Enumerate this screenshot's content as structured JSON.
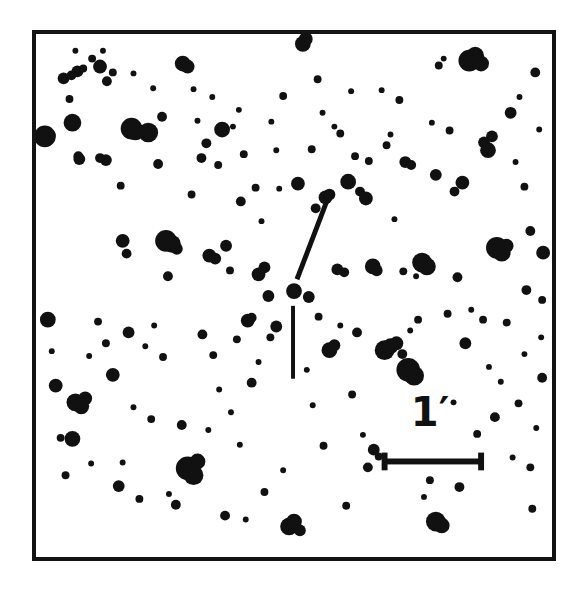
{
  "figure": {
    "kind": "astronomical-finding-chart",
    "background_color": "#ffffff",
    "ink_color": "#111111"
  },
  "frame": {
    "x": 32,
    "y": 30,
    "width": 524,
    "height": 531,
    "border_width": 4,
    "border_color": "#131313"
  },
  "scale_bar": {
    "label": "1′",
    "label_x": 426,
    "label_y": 408,
    "label_font_size": 40,
    "x1": 386,
    "x2": 484,
    "y": 464,
    "line_width": 6,
    "cap_height": 18,
    "cap_width": 6,
    "color": "#111111"
  },
  "target_marker": {
    "color": "#111111",
    "lines": [
      {
        "name": "diagonal-pointer",
        "x1": 328,
        "y1": 198,
        "x2": 297,
        "y2": 279,
        "width": 5
      },
      {
        "name": "vertical-pointer",
        "x1": 293,
        "y1": 306,
        "x2": 293,
        "y2": 380,
        "width": 4
      }
    ],
    "target_position": {
      "x": 294,
      "y": 291
    }
  },
  "chart_data": {
    "type": "scatter",
    "title": "",
    "xlabel": "",
    "ylabel": "",
    "xlim": [
      0,
      585
    ],
    "ylim": [
      0,
      596
    ],
    "grid": false,
    "legend": null,
    "marker_shape": "filled-circle",
    "marker_color": "#111111",
    "point_fields": [
      "x",
      "y",
      "r"
    ],
    "note": "x,y are pixel coordinates in the 585x596 image; r is the plotted disk radius in pixels (a proxy for stellar brightness).",
    "points": [
      [
        41,
        134,
        11
      ],
      [
        45,
        133,
        7
      ],
      [
        60,
        75,
        6
      ],
      [
        68,
        72,
        5
      ],
      [
        74,
        68,
        6
      ],
      [
        76,
        157,
        6
      ],
      [
        80,
        65,
        4
      ],
      [
        72,
        47,
        3
      ],
      [
        75,
        154,
        5
      ],
      [
        69,
        120,
        9
      ],
      [
        66,
        96,
        4
      ],
      [
        89,
        55,
        4
      ],
      [
        97,
        63,
        7
      ],
      [
        100,
        47,
        3
      ],
      [
        104,
        78,
        5
      ],
      [
        110,
        69,
        4
      ],
      [
        103,
        158,
        6
      ],
      [
        97,
        156,
        5
      ],
      [
        118,
        184,
        4
      ],
      [
        120,
        240,
        7
      ],
      [
        124,
        253,
        5
      ],
      [
        131,
        70,
        3
      ],
      [
        129,
        126,
        11
      ],
      [
        133,
        129,
        9
      ],
      [
        146,
        130,
        10
      ],
      [
        151,
        85,
        3
      ],
      [
        156,
        162,
        5
      ],
      [
        160,
        114,
        5
      ],
      [
        164,
        240,
        11
      ],
      [
        170,
        243,
        9
      ],
      [
        175,
        248,
        6
      ],
      [
        166,
        276,
        5
      ],
      [
        181,
        60,
        8
      ],
      [
        186,
        63,
        7
      ],
      [
        190,
        193,
        4
      ],
      [
        196,
        118,
        3
      ],
      [
        200,
        156,
        5
      ],
      [
        192,
        86,
        3
      ],
      [
        205,
        141,
        5
      ],
      [
        208,
        255,
        7
      ],
      [
        214,
        258,
        6
      ],
      [
        211,
        94,
        3
      ],
      [
        217,
        163,
        4
      ],
      [
        221,
        127,
        8
      ],
      [
        225,
        245,
        6
      ],
      [
        232,
        124,
        3
      ],
      [
        229,
        270,
        4
      ],
      [
        238,
        107,
        3
      ],
      [
        243,
        152,
        4
      ],
      [
        240,
        200,
        5
      ],
      [
        247,
        321,
        7
      ],
      [
        251,
        318,
        5
      ],
      [
        255,
        186,
        4
      ],
      [
        261,
        220,
        3
      ],
      [
        258,
        274,
        7
      ],
      [
        264,
        267,
        6
      ],
      [
        268,
        296,
        6
      ],
      [
        271,
        119,
        3
      ],
      [
        276,
        148,
        3
      ],
      [
        279,
        187,
        3
      ],
      [
        283,
        93,
        4
      ],
      [
        294,
        291,
        8
      ],
      [
        309,
        297,
        6
      ],
      [
        298,
        182,
        7
      ],
      [
        303,
        40,
        8
      ],
      [
        306,
        35,
        7
      ],
      [
        312,
        147,
        4
      ],
      [
        318,
        76,
        4
      ],
      [
        323,
        110,
        3
      ],
      [
        316,
        207,
        5
      ],
      [
        326,
        196,
        7
      ],
      [
        330,
        193,
        6
      ],
      [
        335,
        124,
        3
      ],
      [
        341,
        131,
        4
      ],
      [
        338,
        269,
        6
      ],
      [
        345,
        272,
        5
      ],
      [
        349,
        180,
        8
      ],
      [
        352,
        88,
        3
      ],
      [
        356,
        154,
        4
      ],
      [
        361,
        190,
        5
      ],
      [
        367,
        197,
        7
      ],
      [
        370,
        159,
        4
      ],
      [
        374,
        266,
        8
      ],
      [
        378,
        270,
        6
      ],
      [
        383,
        87,
        3
      ],
      [
        388,
        143,
        4
      ],
      [
        392,
        132,
        3
      ],
      [
        396,
        218,
        3
      ],
      [
        401,
        97,
        4
      ],
      [
        407,
        160,
        6
      ],
      [
        413,
        163,
        5
      ],
      [
        405,
        271,
        4
      ],
      [
        418,
        276,
        3
      ],
      [
        424,
        262,
        10
      ],
      [
        429,
        266,
        9
      ],
      [
        434,
        120,
        3
      ],
      [
        438,
        173,
        6
      ],
      [
        441,
        62,
        4
      ],
      [
        446,
        55,
        3
      ],
      [
        452,
        128,
        4
      ],
      [
        457,
        190,
        5
      ],
      [
        460,
        277,
        5
      ],
      [
        465,
        181,
        7
      ],
      [
        472,
        57,
        11
      ],
      [
        478,
        52,
        9
      ],
      [
        484,
        60,
        8
      ],
      [
        487,
        140,
        6
      ],
      [
        491,
        148,
        8
      ],
      [
        495,
        134,
        6
      ],
      [
        500,
        247,
        11
      ],
      [
        505,
        252,
        9
      ],
      [
        510,
        245,
        7
      ],
      [
        514,
        110,
        6
      ],
      [
        519,
        160,
        3
      ],
      [
        523,
        94,
        3
      ],
      [
        528,
        185,
        4
      ],
      [
        534,
        230,
        5
      ],
      [
        539,
        69,
        5
      ],
      [
        543,
        127,
        3
      ],
      [
        547,
        252,
        7
      ],
      [
        530,
        290,
        5
      ],
      [
        546,
        300,
        4
      ],
      [
        545,
        338,
        3
      ],
      [
        44,
        320,
        8
      ],
      [
        48,
        352,
        3
      ],
      [
        52,
        387,
        7
      ],
      [
        57,
        440,
        4
      ],
      [
        62,
        478,
        4
      ],
      [
        72,
        404,
        9
      ],
      [
        78,
        408,
        8
      ],
      [
        82,
        400,
        7
      ],
      [
        69,
        441,
        8
      ],
      [
        86,
        357,
        3
      ],
      [
        88,
        466,
        3
      ],
      [
        95,
        322,
        4
      ],
      [
        103,
        344,
        4
      ],
      [
        110,
        376,
        7
      ],
      [
        116,
        489,
        6
      ],
      [
        120,
        465,
        3
      ],
      [
        126,
        333,
        6
      ],
      [
        131,
        409,
        3
      ],
      [
        137,
        502,
        4
      ],
      [
        143,
        347,
        3
      ],
      [
        149,
        421,
        4
      ],
      [
        152,
        326,
        3
      ],
      [
        161,
        358,
        4
      ],
      [
        167,
        497,
        3
      ],
      [
        174,
        508,
        5
      ],
      [
        180,
        427,
        5
      ],
      [
        186,
        471,
        12
      ],
      [
        192,
        478,
        10
      ],
      [
        196,
        464,
        8
      ],
      [
        201,
        335,
        5
      ],
      [
        207,
        432,
        3
      ],
      [
        212,
        356,
        4
      ],
      [
        218,
        391,
        3
      ],
      [
        224,
        519,
        5
      ],
      [
        230,
        414,
        3
      ],
      [
        236,
        340,
        4
      ],
      [
        239,
        447,
        3
      ],
      [
        245,
        523,
        3
      ],
      [
        251,
        384,
        5
      ],
      [
        258,
        363,
        3
      ],
      [
        264,
        495,
        4
      ],
      [
        270,
        338,
        4
      ],
      [
        276,
        327,
        6
      ],
      [
        283,
        473,
        3
      ],
      [
        289,
        530,
        9
      ],
      [
        294,
        525,
        8
      ],
      [
        300,
        534,
        6
      ],
      [
        307,
        371,
        3
      ],
      [
        313,
        407,
        3
      ],
      [
        319,
        317,
        4
      ],
      [
        324,
        448,
        4
      ],
      [
        330,
        351,
        8
      ],
      [
        335,
        346,
        6
      ],
      [
        341,
        326,
        3
      ],
      [
        347,
        509,
        4
      ],
      [
        353,
        396,
        4
      ],
      [
        358,
        333,
        5
      ],
      [
        364,
        437,
        3
      ],
      [
        369,
        470,
        5
      ],
      [
        375,
        452,
        6
      ],
      [
        380,
        459,
        4
      ],
      [
        386,
        351,
        10
      ],
      [
        392,
        347,
        8
      ],
      [
        398,
        344,
        7
      ],
      [
        404,
        355,
        5
      ],
      [
        410,
        371,
        12
      ],
      [
        416,
        377,
        10
      ],
      [
        412,
        331,
        3
      ],
      [
        420,
        320,
        4
      ],
      [
        426,
        500,
        3
      ],
      [
        432,
        483,
        4
      ],
      [
        438,
        525,
        10
      ],
      [
        444,
        529,
        8
      ],
      [
        450,
        314,
        4
      ],
      [
        456,
        404,
        3
      ],
      [
        462,
        490,
        5
      ],
      [
        468,
        344,
        6
      ],
      [
        474,
        310,
        3
      ],
      [
        480,
        436,
        4
      ],
      [
        486,
        320,
        4
      ],
      [
        492,
        368,
        3
      ],
      [
        498,
        419,
        5
      ],
      [
        504,
        383,
        3
      ],
      [
        510,
        323,
        4
      ],
      [
        516,
        460,
        3
      ],
      [
        522,
        405,
        4
      ],
      [
        528,
        355,
        3
      ],
      [
        534,
        470,
        4
      ],
      [
        540,
        430,
        3
      ],
      [
        546,
        379,
        5
      ],
      [
        536,
        512,
        4
      ]
    ]
  }
}
